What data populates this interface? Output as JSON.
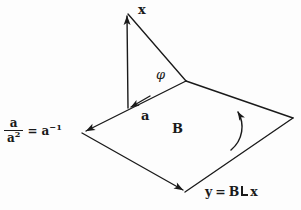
{
  "figure": {
    "background_color": "#fdfdfd",
    "stroke_color": "#1a1a1a",
    "labels": {
      "vector_x": "x",
      "vector_a": "a",
      "bivector_B": "B",
      "angle_phi": "φ",
      "inverse_numerator": "a",
      "inverse_denominator_base": "a",
      "inverse_denominator_exp": "2",
      "equals": "=",
      "inverse_result_base": "a",
      "inverse_result_exp": "−1",
      "result_lhs": "y",
      "result_equals": "=",
      "result_bivector": "B",
      "result_operator": "⌞",
      "result_vector": "x"
    },
    "geometry": {
      "plane_vertices": [
        {
          "name": "apex",
          "x": 186,
          "y": 81
        },
        {
          "name": "right",
          "x": 293,
          "y": 118
        },
        {
          "name": "bottom",
          "x": 185,
          "y": 192
        },
        {
          "name": "left",
          "x": 82,
          "y": 133
        }
      ],
      "vertical_segment": {
        "x1": 128,
        "y1": 108,
        "x2": 127,
        "y2": 12
      },
      "hypotenuse": {
        "x1": 127,
        "y1": 12,
        "x2": 186,
        "y2": 81
      },
      "arrow_tips": [
        {
          "name": "x-arrow-tip",
          "x": 127,
          "y": 11
        },
        {
          "name": "a-arrow-tip",
          "x": 129,
          "y": 108
        },
        {
          "name": "left-vertex-arrow-tip",
          "x": 84,
          "y": 132
        },
        {
          "name": "bottom-vertex-arrow-tip",
          "x": 184,
          "y": 191
        },
        {
          "name": "orientation-arc-tip",
          "x": 239,
          "y": 108
        }
      ],
      "orientation_arc": {
        "start_x": 232,
        "start_y": 148,
        "end_x": 239,
        "end_y": 108
      }
    }
  }
}
